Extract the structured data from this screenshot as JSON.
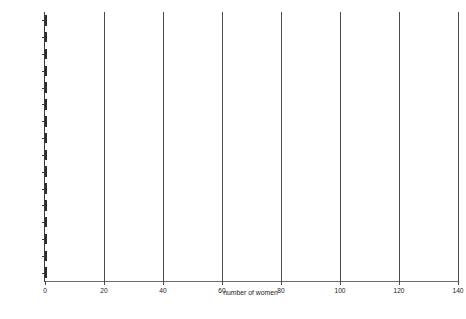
{
  "chart_data": {
    "type": "bar",
    "orientation": "horizontal",
    "title": "",
    "xlabel": "number of women",
    "ylabel": "",
    "xlim": [
      0,
      140
    ],
    "xticks": [
      0,
      20,
      40,
      60,
      80,
      100,
      120,
      140
    ],
    "grid": true,
    "legend": null,
    "categories": [
      "Shaanxi",
      "Henan",
      "Fujian",
      "Jiangxi",
      "Hebei",
      "Guangxi",
      "Shandong",
      "Guandong",
      "Hunan",
      "Sichan",
      "Hubei",
      "Anhui",
      "Unknown",
      "Zhejiang",
      "Jiangbei",
      "Jiangnan"
    ],
    "values": [
      1,
      1,
      1,
      2,
      2,
      4,
      5,
      6,
      7,
      8,
      10,
      10,
      23,
      71,
      87,
      117
    ],
    "bar_color": "#5e5e5e",
    "bar_edge_color": "#2b2b2b"
  }
}
